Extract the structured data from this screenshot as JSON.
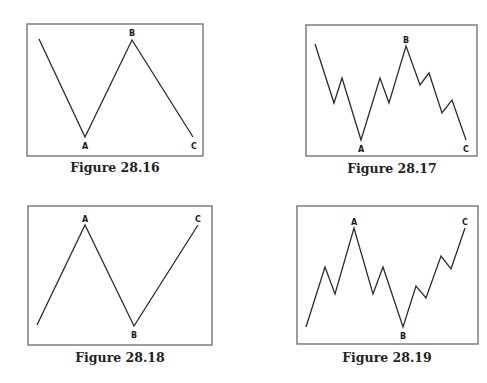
{
  "figures": [
    {
      "caption": "Figure 28.16",
      "frame": {
        "x": 27,
        "y": 24,
        "w": 176,
        "h": 132
      },
      "points": [
        [
          39,
          39
        ],
        [
          85,
          137
        ],
        [
          132,
          40
        ],
        [
          193,
          137
        ]
      ],
      "labels": [
        {
          "text": "A",
          "x": 85,
          "y": 149
        },
        {
          "text": "B",
          "x": 132,
          "y": 36
        },
        {
          "text": "C",
          "x": 194,
          "y": 149
        }
      ],
      "caption_pos": {
        "x": 115,
        "y": 172
      }
    },
    {
      "caption": "Figure 28.17",
      "frame": {
        "x": 306,
        "y": 25,
        "w": 171,
        "h": 131
      },
      "points": [
        [
          315,
          44
        ],
        [
          334,
          103
        ],
        [
          342,
          78
        ],
        [
          361,
          140
        ],
        [
          380,
          78
        ],
        [
          389,
          103
        ],
        [
          406,
          46
        ],
        [
          420,
          85
        ],
        [
          429,
          73
        ],
        [
          442,
          113
        ],
        [
          452,
          100
        ],
        [
          466,
          140
        ]
      ],
      "labels": [
        {
          "text": "A",
          "x": 361,
          "y": 152
        },
        {
          "text": "B",
          "x": 406,
          "y": 43
        },
        {
          "text": "C",
          "x": 466,
          "y": 152
        }
      ],
      "caption_pos": {
        "x": 392,
        "y": 173
      }
    },
    {
      "caption": "Figure 28.18",
      "frame": {
        "x": 28,
        "y": 206,
        "w": 184,
        "h": 139
      },
      "points": [
        [
          37,
          325
        ],
        [
          85,
          225
        ],
        [
          134,
          326
        ],
        [
          198,
          225
        ]
      ],
      "labels": [
        {
          "text": "A",
          "x": 85,
          "y": 222
        },
        {
          "text": "B",
          "x": 134,
          "y": 338
        },
        {
          "text": "C",
          "x": 198,
          "y": 222
        }
      ],
      "caption_pos": {
        "x": 120,
        "y": 362
      }
    },
    {
      "caption": "Figure 28.19",
      "frame": {
        "x": 297,
        "y": 206,
        "w": 181,
        "h": 138
      },
      "points": [
        [
          306,
          327
        ],
        [
          325,
          267
        ],
        [
          335,
          294
        ],
        [
          354,
          228
        ],
        [
          373,
          294
        ],
        [
          383,
          267
        ],
        [
          403,
          327
        ],
        [
          416,
          286
        ],
        [
          426,
          298
        ],
        [
          441,
          256
        ],
        [
          451,
          269
        ],
        [
          465,
          228
        ]
      ],
      "labels": [
        {
          "text": "A",
          "x": 354,
          "y": 225
        },
        {
          "text": "B",
          "x": 403,
          "y": 339
        },
        {
          "text": "C",
          "x": 465,
          "y": 225
        }
      ],
      "caption_pos": {
        "x": 387,
        "y": 362
      }
    }
  ]
}
